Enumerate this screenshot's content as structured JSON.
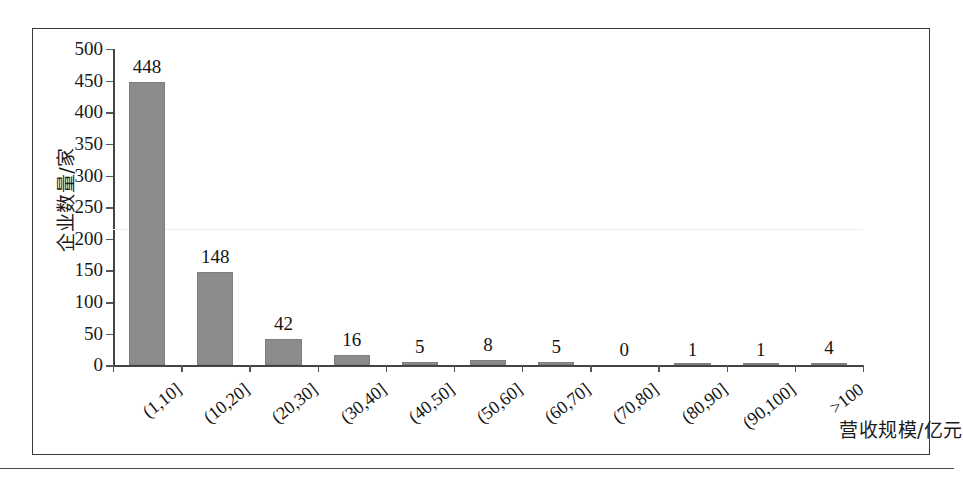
{
  "chart_data": {
    "type": "bar",
    "title": "",
    "subtitle": "",
    "xlabel": "营收规模/亿元",
    "ylabel": "企业数量/家",
    "categories": [
      "(1,10]",
      "(10,20]",
      "(20,30]",
      "(30,40]",
      "(40,50]",
      "(50,60]",
      "(60,70]",
      "(70,80]",
      "(80,90]",
      "(90,100]",
      ">100"
    ],
    "values": [
      448,
      148,
      42,
      16,
      5,
      8,
      5,
      0,
      1,
      1,
      4
    ],
    "value_labels": [
      "448",
      "148",
      "42",
      "16",
      "5",
      "8",
      "5",
      "0",
      "1",
      "1",
      "4"
    ],
    "ylim": [
      0,
      500
    ],
    "ytick_step": 50,
    "ytick_labels": [
      "0",
      "50",
      "100",
      "150",
      "200",
      "250",
      "300",
      "350",
      "400",
      "450",
      "500"
    ],
    "ytick_values": [
      0,
      50,
      100,
      150,
      200,
      250,
      300,
      350,
      400,
      450,
      500
    ],
    "grid": false,
    "legend": false,
    "legend_position": "none",
    "bar_color": "#8c8c8c",
    "axis_color": "#444444",
    "text_color": "#141414",
    "background": "#ffffff",
    "frame_border_color": "#3a3a3a"
  }
}
